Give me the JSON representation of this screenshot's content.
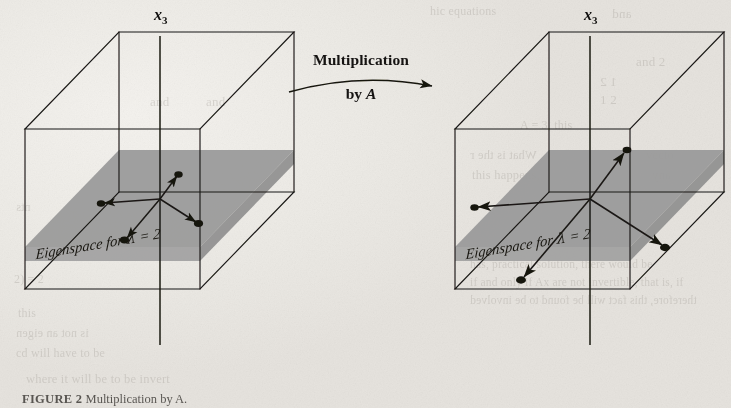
{
  "figure": {
    "caption_label": "FIGURE 2",
    "caption_text": "Multiplication by A.",
    "transform_label_line1": "Multiplication",
    "transform_label_line2_prefix": "by ",
    "transform_label_line2_matrix": "A",
    "arrow_icon": "curved-right-arrow-icon"
  },
  "panels": [
    {
      "id": "before",
      "name": "left-cube-panel",
      "axis_label": "x",
      "axis_subscript": "3",
      "eigenspace_label": "Eigenspace for ",
      "eigenspace_lambda": "λ",
      "eigenspace_equals": " = 2",
      "vector_count": 4,
      "vector_scale": 1
    },
    {
      "id": "after",
      "name": "right-cube-panel",
      "axis_label": "x",
      "axis_subscript": "3",
      "eigenspace_label": "Eigenspace for ",
      "eigenspace_lambda": "λ",
      "eigenspace_equals": " = 2",
      "vector_count": 4,
      "vector_scale": 2
    }
  ],
  "colors": {
    "paper": "#eceae6",
    "ink": "#1a1815",
    "plane_fill": "#9a9a9a",
    "plane_fill_dark": "#8d8d8d",
    "bleed_text": "#9a958e"
  },
  "bleed_text": [
    {
      "t": "and",
      "x": 612,
      "y": 6,
      "s": 13
    },
    {
      "t": "hic equations",
      "x": 430,
      "y": 4,
      "s": 12
    },
    {
      "t": "and  2",
      "x": 636,
      "y": 54,
      "s": 13
    },
    {
      "t": "1    2",
      "x": 600,
      "y": 74,
      "s": 13
    },
    {
      "t": "1    2",
      "x": 600,
      "y": 92,
      "s": 13
    },
    {
      "t": "A = 3, this",
      "x": 520,
      "y": 118,
      "s": 12
    },
    {
      "t": "What is the r",
      "x": 470,
      "y": 148,
      "s": 12.5
    },
    {
      "t": "this happens, ",
      "x": 472,
      "y": 168,
      "s": 12.5
    },
    {
      "t": "vecto",
      "x": 646,
      "y": 148,
      "s": 12.5
    },
    {
      "t": "any",
      "x": 652,
      "y": 168,
      "s": 12.5
    },
    {
      "t": "has, practical solution, there would be",
      "x": 470,
      "y": 258,
      "s": 11.5
    },
    {
      "t": "if and only if Ax are not invertible, that is, if",
      "x": 470,
      "y": 276,
      "s": 11.5
    },
    {
      "t": "therefore, this fact will be found to be involved",
      "x": 470,
      "y": 294,
      "s": 11.5
    },
    {
      "t": "where it will be to be invert",
      "x": 26,
      "y": 372,
      "s": 12.5
    },
    {
      "t": "this",
      "x": 18,
      "y": 306,
      "s": 12
    },
    {
      "t": "is not an eigen",
      "x": 16,
      "y": 326,
      "s": 12
    },
    {
      "t": "cd will have to be",
      "x": 16,
      "y": 346,
      "s": 12
    },
    {
      "t": "2)   = 2",
      "x": 14,
      "y": 272,
      "s": 12
    },
    {
      "t": "nts",
      "x": 16,
      "y": 200,
      "s": 12
    },
    {
      "t": "and",
      "x": 150,
      "y": 94,
      "s": 13
    },
    {
      "t": "and",
      "x": 206,
      "y": 94,
      "s": 13
    }
  ]
}
